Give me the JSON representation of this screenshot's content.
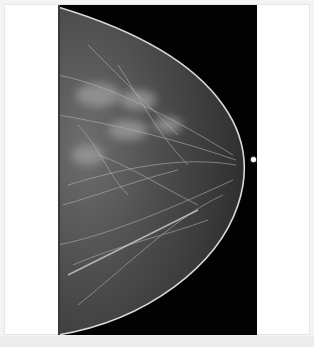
{
  "image": {
    "type": "mammogram",
    "view": "craniocaudal",
    "colors": {
      "background": "#ffffff",
      "film": "#020202",
      "tissue": "#7a7a7a",
      "skin_line": "#d8d8d8"
    }
  }
}
